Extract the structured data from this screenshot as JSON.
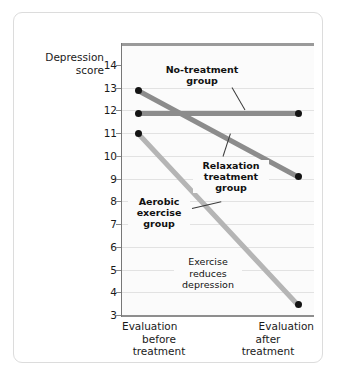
{
  "chart_data": {
    "type": "line",
    "title": "",
    "xlabel": "",
    "ylabel": "Depression score",
    "ylabel_line1": "Depression",
    "ylabel_line2": "score",
    "ylim": [
      3,
      14
    ],
    "yticks": [
      14,
      13,
      12,
      11,
      10,
      9,
      8,
      7,
      6,
      5,
      4,
      3
    ],
    "grid": true,
    "legend_position": "inline-annotations",
    "categories": [
      "Evaluation before treatment",
      "Evaluation after treatment"
    ],
    "x_tick_labels": [
      {
        "l1": "Evaluation",
        "l2": "before",
        "l3": "treatment"
      },
      {
        "l1": "Evaluation",
        "l2": "after",
        "l3": "treatment"
      }
    ],
    "series": [
      {
        "name": "No-treatment group",
        "label_lines": [
          "No-treatment",
          "group"
        ],
        "values": [
          11.85,
          11.85
        ],
        "color": "#8c8c8c"
      },
      {
        "name": "Relaxation treatment group",
        "label_lines": [
          "Relaxation",
          "treatment",
          "group"
        ],
        "values": [
          12.9,
          9.1
        ],
        "color": "#8c8c8c"
      },
      {
        "name": "Aerobic exercise group",
        "label_lines": [
          "Aerobic",
          "exercise",
          "group"
        ],
        "values": [
          11.0,
          3.45
        ],
        "color": "#b5b5b5"
      }
    ],
    "annotations": [
      {
        "text": "Exercise reduces depression",
        "lines": [
          "Exercise",
          "reduces",
          "depression"
        ],
        "style": "plain"
      }
    ]
  },
  "colors": {
    "plot_background": "#fbfbfb",
    "gridline": "#e2e2e2",
    "axis": "#777777",
    "marker": "#141414",
    "card_border": "#dcdcdc",
    "text": "#1a1a1a"
  }
}
